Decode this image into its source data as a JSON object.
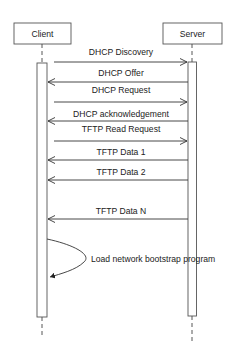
{
  "diagram": {
    "type": "sequence",
    "participants": [
      {
        "id": "client",
        "label": "Client"
      },
      {
        "id": "server",
        "label": "Server"
      }
    ],
    "messages": [
      {
        "label": "DHCP Discovery",
        "from": "client",
        "to": "server"
      },
      {
        "label": "DHCP Offer",
        "from": "server",
        "to": "client"
      },
      {
        "label": "DHCP Request",
        "from": "client",
        "to": "server"
      },
      {
        "label": "DHCP acknowledgement",
        "from": "server",
        "to": "client"
      },
      {
        "label": "TFTP Read Request",
        "from": "client",
        "to": "server"
      },
      {
        "label": "TFTP Data 1",
        "from": "server",
        "to": "client"
      },
      {
        "label": "TFTP Data 2",
        "from": "server",
        "to": "client"
      },
      {
        "label": "TFTP Data N",
        "from": "server",
        "to": "client"
      }
    ],
    "self_action": {
      "label": "Load network bootstrap program",
      "participant": "client"
    },
    "colors": {
      "line": "#333333",
      "box_border": "#555555",
      "text": "#222222",
      "background": "#ffffff"
    }
  }
}
